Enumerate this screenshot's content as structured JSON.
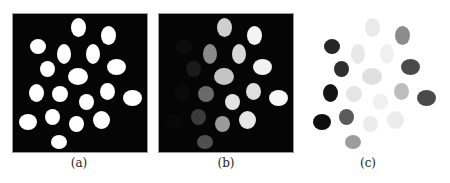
{
  "figure": {
    "panels": [
      {
        "id": "a",
        "label": "(a)",
        "left": 13,
        "framed": true,
        "label_x": 49
      },
      {
        "id": "b",
        "label": "(b)",
        "left": 159,
        "framed": true,
        "label_x": 196
      },
      {
        "id": "c",
        "label": "(c)",
        "left": 307,
        "framed": false,
        "label_x": 338
      }
    ],
    "blobs": [
      {
        "x": 65,
        "y": 13,
        "w": 15,
        "h": 19,
        "b": "#cfcfcf",
        "c": "#eaeaea"
      },
      {
        "x": 95,
        "y": 21,
        "w": 15,
        "h": 19,
        "b": "#f4f4f4",
        "c": "#8c8c8c"
      },
      {
        "x": 25,
        "y": 32,
        "w": 16,
        "h": 15,
        "b": "#0c0c0c",
        "c": "#262626"
      },
      {
        "x": 51,
        "y": 40,
        "w": 14,
        "h": 20,
        "b": "#8a8a8a",
        "c": "#e8e8e8"
      },
      {
        "x": 80,
        "y": 40,
        "w": 14,
        "h": 20,
        "b": "#d6d6d6",
        "c": "#f0f0f0"
      },
      {
        "x": 34,
        "y": 55,
        "w": 15,
        "h": 16,
        "b": "#1a1a1a",
        "c": "#2e2e2e"
      },
      {
        "x": 103,
        "y": 53,
        "w": 19,
        "h": 16,
        "b": "#f2f2f2",
        "c": "#4a4a4a"
      },
      {
        "x": 65,
        "y": 62,
        "w": 20,
        "h": 17,
        "b": "#c4c4c4",
        "c": "#e0e0e0"
      },
      {
        "x": 23,
        "y": 79,
        "w": 15,
        "h": 18,
        "b": "#0a0a0a",
        "c": "#141414"
      },
      {
        "x": 47,
        "y": 80,
        "w": 16,
        "h": 16,
        "b": "#6a6a6a",
        "c": "#e6e6e6"
      },
      {
        "x": 94,
        "y": 77,
        "w": 15,
        "h": 17,
        "b": "#dedede",
        "c": "#bdbdbd"
      },
      {
        "x": 73,
        "y": 88,
        "w": 15,
        "h": 16,
        "b": "#e2e2e2",
        "c": "#f0f0f0"
      },
      {
        "x": 119,
        "y": 84,
        "w": 19,
        "h": 16,
        "b": "#f8f8f8",
        "c": "#4a4a4a"
      },
      {
        "x": 15,
        "y": 108,
        "w": 18,
        "h": 16,
        "b": "#080808",
        "c": "#0e0e0e"
      },
      {
        "x": 39,
        "y": 103,
        "w": 15,
        "h": 16,
        "b": "#3a3a3a",
        "c": "#5a5a5a"
      },
      {
        "x": 63,
        "y": 110,
        "w": 15,
        "h": 16,
        "b": "#9a9a9a",
        "c": "#ececec"
      },
      {
        "x": 88,
        "y": 106,
        "w": 17,
        "h": 18,
        "b": "#e6e6e6",
        "c": "#ececec"
      },
      {
        "x": 46,
        "y": 128,
        "w": 16,
        "h": 14,
        "b": "#505050",
        "c": "#9c9c9c"
      }
    ],
    "colors": {
      "panel_a_blob": "#ffffff",
      "frame_bg": "#050505"
    }
  }
}
